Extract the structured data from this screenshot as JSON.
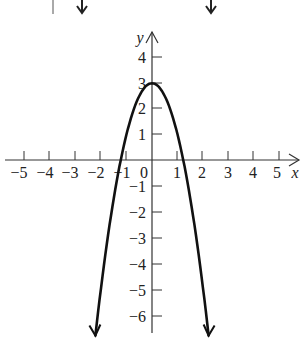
{
  "chart_data": {
    "type": "line",
    "title": "",
    "xlabel": "x",
    "ylabel": "y",
    "function": "y = -2x^2 + 3",
    "xlim": [
      -5.8,
      5.9
    ],
    "ylim": [
      -6.9,
      5.1
    ],
    "grid": false,
    "legend": null,
    "x_ticks": [
      -5,
      -4,
      -3,
      -2,
      -1,
      1,
      2,
      3,
      4,
      5
    ],
    "y_ticks": [
      4,
      3,
      2,
      1,
      -1,
      -2,
      -3,
      -4,
      -5,
      -6
    ],
    "x_tick_labels": [
      "−5",
      "−4",
      "−3",
      "−2",
      "−1",
      "1",
      "2",
      "3",
      "4",
      "5"
    ],
    "y_tick_labels": [
      "4",
      "3",
      "2",
      "1",
      "−1",
      "−2",
      "−3",
      "−4",
      "−5",
      "−6"
    ],
    "origin_label": "0",
    "series": [
      {
        "name": "parabola",
        "x": [
          -2.22,
          -2,
          -1.5,
          -1.22,
          -1,
          -0.5,
          0,
          0.5,
          1,
          1.22,
          1.5,
          2,
          2.22
        ],
        "y": [
          -6.86,
          -5,
          -1.5,
          0,
          1,
          2.5,
          3,
          2.5,
          1,
          0,
          -1.5,
          -5,
          -6.86
        ],
        "vertex": [
          0,
          3
        ],
        "x_intercepts": [
          -1.22,
          1.22
        ],
        "ends_with_arrows": true
      }
    ]
  },
  "labels": {
    "x_axis": "x",
    "y_axis": "y",
    "origin": "0",
    "xt": [
      "−5",
      "−4",
      "−3",
      "−2",
      "−1",
      "1",
      "2",
      "3",
      "4",
      "5"
    ],
    "yt": [
      "4",
      "3",
      "2",
      "1",
      "−1",
      "−2",
      "−3",
      "−4",
      "−5",
      "−6"
    ]
  },
  "style": {
    "curve_color": "#111111",
    "axis_color": "#333333"
  }
}
